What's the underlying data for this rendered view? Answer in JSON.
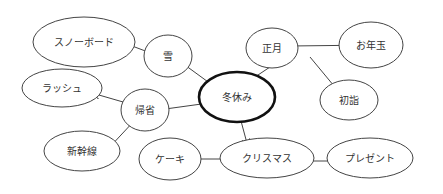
{
  "diagram": {
    "type": "mind-map",
    "center": "冬休み",
    "nodes": [
      {
        "id": "fuyuyasumi",
        "label": "冬休み",
        "cx": 237,
        "cy": 97,
        "rx": 38,
        "ry": 25,
        "center": true
      },
      {
        "id": "yuki",
        "label": "雪",
        "cx": 168,
        "cy": 56,
        "rx": 24,
        "ry": 21
      },
      {
        "id": "snowboard",
        "label": "スノーボード",
        "cx": 84,
        "cy": 42,
        "rx": 51,
        "ry": 25
      },
      {
        "id": "shogatsu",
        "label": "正月",
        "cx": 272,
        "cy": 48,
        "rx": 26,
        "ry": 20
      },
      {
        "id": "otoshidama",
        "label": "お年玉",
        "cx": 371,
        "cy": 45,
        "rx": 32,
        "ry": 23
      },
      {
        "id": "hatsumode",
        "label": "初詣",
        "cx": 349,
        "cy": 100,
        "rx": 29,
        "ry": 20
      },
      {
        "id": "rush",
        "label": "ラッシュ",
        "cx": 62,
        "cy": 88,
        "rx": 40,
        "ry": 19
      },
      {
        "id": "kisei",
        "label": "帰省",
        "cx": 145,
        "cy": 110,
        "rx": 24,
        "ry": 21
      },
      {
        "id": "shinkansen",
        "label": "新幹線",
        "cx": 82,
        "cy": 151,
        "rx": 38,
        "ry": 20
      },
      {
        "id": "cake",
        "label": "ケーキ",
        "cx": 170,
        "cy": 159,
        "rx": 31,
        "ry": 21
      },
      {
        "id": "christmas",
        "label": "クリスマス",
        "cx": 267,
        "cy": 158,
        "rx": 47,
        "ry": 20
      },
      {
        "id": "present",
        "label": "プレゼント",
        "cx": 370,
        "cy": 158,
        "rx": 43,
        "ry": 20
      }
    ],
    "edges": [
      {
        "from": "fuyuyasumi",
        "to": "yuki",
        "x1": 215,
        "y1": 87,
        "x2": 178,
        "y2": 60
      },
      {
        "from": "yuki",
        "to": "snowboard",
        "x1": 148,
        "y1": 52,
        "x2": 111,
        "y2": 38
      },
      {
        "from": "fuyuyasumi",
        "to": "shogatsu",
        "x1": 252,
        "y1": 79,
        "x2": 288,
        "y2": 55
      },
      {
        "from": "shogatsu",
        "to": "otoshidama",
        "x1": 290,
        "y1": 46,
        "x2": 376,
        "y2": 45
      },
      {
        "from": "shogatsu",
        "to": "hatsumode",
        "x1": 310,
        "y1": 57,
        "x2": 339,
        "y2": 92
      },
      {
        "from": "fuyuyasumi",
        "to": "kisei",
        "x1": 216,
        "y1": 102,
        "x2": 158,
        "y2": 110
      },
      {
        "from": "kisei",
        "to": "rush",
        "x1": 130,
        "y1": 104,
        "x2": 92,
        "y2": 93
      },
      {
        "from": "kisei",
        "to": "shinkansen",
        "x1": 135,
        "y1": 120,
        "x2": 107,
        "y2": 150
      },
      {
        "from": "fuyuyasumi",
        "to": "christmas",
        "x1": 241,
        "y1": 121,
        "x2": 248,
        "y2": 147
      },
      {
        "from": "christmas",
        "to": "cake",
        "x1": 231,
        "y1": 159,
        "x2": 193,
        "y2": 159
      },
      {
        "from": "christmas",
        "to": "present",
        "x1": 293,
        "y1": 161,
        "x2": 345,
        "y2": 161
      }
    ],
    "colors": {
      "line": "#444444",
      "center_border": "#111111",
      "text": "#333333",
      "background": "#ffffff"
    }
  }
}
